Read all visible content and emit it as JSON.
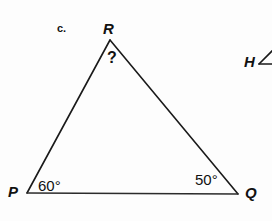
{
  "figure": {
    "item_label": "c.",
    "background_color": "#fdfdfd",
    "stroke_color": "#1a1a1a",
    "text_color": "#111111",
    "triangle": {
      "name": "triangle-PQR",
      "vertices": [
        {
          "name": "P",
          "label": "P",
          "x": 27,
          "y": 193
        },
        {
          "name": "Q",
          "label": "Q",
          "x": 238,
          "y": 194
        },
        {
          "name": "R",
          "label": "R",
          "x": 110,
          "y": 40
        }
      ],
      "angles": [
        {
          "at": "P",
          "label": "60°",
          "value": 60
        },
        {
          "at": "Q",
          "label": "50°",
          "value": 50
        },
        {
          "at": "R",
          "label": "?",
          "value": null
        }
      ]
    },
    "side_figure": {
      "label": "H",
      "icon": "angle-symbol",
      "clipped": true
    }
  }
}
